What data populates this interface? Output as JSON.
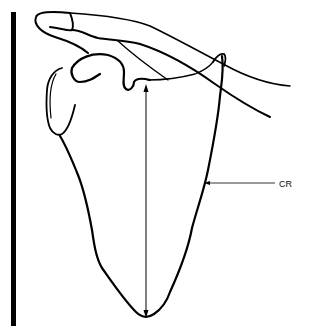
{
  "figure": {
    "labels": {
      "cr": "CR"
    },
    "colors": {
      "line": "#000000",
      "background": "#ffffff"
    }
  }
}
